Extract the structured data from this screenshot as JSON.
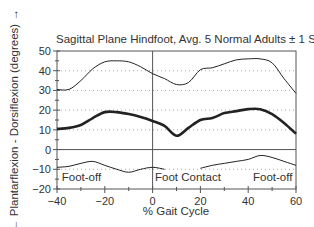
{
  "chart_data": {
    "type": "line",
    "title": "Sagittal Plane Hindfoot, Avg. 5 Normal Adults ± 1 STD",
    "xlabel": "% Gait Cycle",
    "ylabel": "← Plantarflexion - Dorsiflexion (degrees) →",
    "xlim": [
      -40,
      60
    ],
    "ylim": [
      -20,
      50
    ],
    "xticks": [
      -40,
      -20,
      0,
      20,
      40,
      60
    ],
    "xtick_labels": [
      "−40",
      "−20",
      "0",
      "20",
      "40",
      "60"
    ],
    "yticks": [
      50,
      40,
      30,
      20,
      10,
      0,
      -10,
      -20
    ],
    "ytick_labels": [
      "50",
      "40",
      "30",
      "20",
      "10",
      "0",
      "−10",
      "−20"
    ],
    "grid": "dotted horizontal at 40, 30, 20, 10, -10",
    "vertical_line_at": 0,
    "zero_line": true,
    "series": [
      {
        "name": "Mean",
        "style": "thick",
        "x": [
          -40,
          -35,
          -30,
          -25,
          -20,
          -15,
          -10,
          -5,
          0,
          5,
          10,
          15,
          20,
          25,
          30,
          35,
          40,
          45,
          50,
          55,
          60
        ],
        "values": [
          10.5,
          11,
          12.5,
          16,
          19,
          19,
          18,
          16.5,
          14.5,
          12,
          7,
          11,
          15,
          16,
          18.5,
          19.5,
          20.5,
          20.5,
          18,
          13.5,
          8
        ]
      },
      {
        "name": "Mean + 1 STD",
        "style": "thin",
        "x": [
          -40,
          -35,
          -30,
          -25,
          -20,
          -15,
          -10,
          -5,
          0,
          5,
          10,
          15,
          20,
          25,
          30,
          35,
          40,
          45,
          50,
          55,
          60
        ],
        "values": [
          30.5,
          30.5,
          35,
          41,
          44.5,
          45,
          44.5,
          42,
          38.5,
          36,
          33,
          34,
          40.5,
          41.5,
          43.5,
          45.5,
          46,
          46,
          44,
          36,
          28.5
        ]
      },
      {
        "name": "Mean - 1 STD",
        "style": "thin",
        "x": [
          -40,
          -35,
          -30,
          -25,
          -20,
          -15,
          -10,
          -5,
          0,
          5,
          10,
          15,
          20,
          25,
          30,
          35,
          40,
          45,
          50,
          55,
          60
        ],
        "values": [
          -9,
          -8.5,
          -7,
          -6,
          -8,
          -10,
          -11.5,
          -10,
          -9,
          -10,
          null,
          null,
          -9.5,
          -8,
          -7,
          -6,
          -5,
          -3,
          -4,
          -6,
          -8
        ]
      }
    ],
    "annotations": [
      {
        "text": "Foot-off",
        "x": -38,
        "y": -14
      },
      {
        "text": "Foot Contact",
        "x": 1,
        "y": -14
      },
      {
        "text": "Foot-off",
        "x": 42,
        "y": -14
      }
    ]
  }
}
